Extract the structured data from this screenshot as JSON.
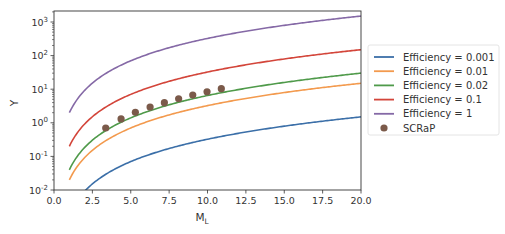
{
  "chart_data": {
    "type": "line",
    "title": "",
    "xlabel": "M",
    "xlabel_subscript": "L",
    "ylabel": "Y",
    "xlim": [
      0.0,
      20.0
    ],
    "ylim": [
      0.01,
      2000
    ],
    "yscale": "log",
    "grid": false,
    "legend_position": "outside right",
    "x_ticks": [
      "0.0",
      "2.5",
      "5.0",
      "7.5",
      "10.0",
      "12.5",
      "15.0",
      "17.5",
      "20.0"
    ],
    "y_ticks": [
      {
        "base": "10",
        "exp": "-2"
      },
      {
        "base": "10",
        "exp": "-1"
      },
      {
        "base": "10",
        "exp": "0"
      },
      {
        "base": "10",
        "exp": "1"
      },
      {
        "base": "10",
        "exp": "2"
      },
      {
        "base": "10",
        "exp": "3"
      }
    ],
    "model": "Y = 2 * Efficiency * M_L^2.21",
    "series": [
      {
        "name": "Efficiency = 0.001",
        "efficiency": 0.001,
        "color": "#3b6fa8",
        "x_start": 1.0,
        "x_end": 20.0,
        "x": [
          2,
          4,
          6,
          8,
          10,
          12,
          14,
          16,
          18,
          20
        ],
        "values": [
          0.0093,
          0.043,
          0.105,
          0.198,
          0.325,
          0.487,
          0.685,
          0.92,
          1.19,
          1.51
        ]
      },
      {
        "name": "Efficiency = 0.01",
        "efficiency": 0.01,
        "color": "#f39a4e",
        "x_start": 1.0,
        "x_end": 20.0,
        "x": [
          1,
          2,
          4,
          6,
          8,
          10,
          12,
          14,
          16,
          18,
          20
        ],
        "values": [
          0.02,
          0.093,
          0.43,
          1.05,
          1.98,
          3.25,
          4.87,
          6.85,
          9.2,
          11.9,
          15.1
        ]
      },
      {
        "name": "Efficiency = 0.02",
        "efficiency": 0.02,
        "color": "#4f9a4a",
        "x_start": 1.0,
        "x_end": 20.0,
        "x": [
          1,
          2,
          4,
          6,
          8,
          10,
          12,
          14,
          16,
          18,
          20
        ],
        "values": [
          0.04,
          0.185,
          0.86,
          2.1,
          3.96,
          6.5,
          9.74,
          13.7,
          18.4,
          23.8,
          30.2
        ]
      },
      {
        "name": "Efficiency = 0.1",
        "efficiency": 0.1,
        "color": "#d3453a",
        "x_start": 1.0,
        "x_end": 20.0,
        "x": [
          1,
          2,
          4,
          6,
          8,
          10,
          12,
          14,
          16,
          18,
          20
        ],
        "values": [
          0.2,
          0.93,
          4.3,
          10.5,
          19.8,
          32.5,
          48.7,
          68.5,
          92,
          119,
          151
        ]
      },
      {
        "name": "Efficiency = 1",
        "efficiency": 1,
        "color": "#8569a6",
        "x_start": 1.0,
        "x_end": 20.0,
        "x": [
          1,
          2,
          4,
          6,
          8,
          10,
          12,
          14,
          16,
          18,
          20
        ],
        "values": [
          2,
          9.3,
          43,
          105,
          198,
          325,
          487,
          685,
          920,
          1190,
          1510
        ]
      }
    ],
    "scatter": {
      "name": "SCRaP",
      "color": "#7b5a4a",
      "x": [
        3.37,
        4.37,
        5.3,
        6.26,
        7.19,
        8.12,
        9.04,
        9.97,
        10.9
      ],
      "values": [
        0.7,
        1.3,
        2.05,
        2.95,
        3.96,
        5.2,
        6.7,
        8.4,
        10.4
      ]
    }
  },
  "axes": {
    "ylabel": "Y",
    "xlabel_main": "M",
    "xlabel_sub": "L"
  },
  "legend": {
    "items": [
      {
        "label": "Efficiency = 0.001",
        "color": "#3b6fa8",
        "kind": "line"
      },
      {
        "label": "Efficiency = 0.01",
        "color": "#f39a4e",
        "kind": "line"
      },
      {
        "label": "Efficiency = 0.02",
        "color": "#4f9a4a",
        "kind": "line"
      },
      {
        "label": "Efficiency = 0.1",
        "color": "#d3453a",
        "kind": "line"
      },
      {
        "label": "Efficiency = 1",
        "color": "#8569a6",
        "kind": "line"
      },
      {
        "label": "SCRaP",
        "color": "#7b5a4a",
        "kind": "marker"
      }
    ]
  }
}
